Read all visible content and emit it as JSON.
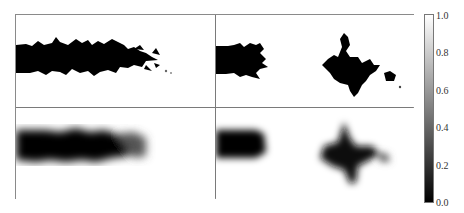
{
  "figure": {
    "panels": [
      {
        "id": "top-left",
        "description": "binary sharp dark plume extending from left edge, fragmented fingers at tip"
      },
      {
        "id": "top-right",
        "description": "binary sharp dark slab at left and detached irregular blob in center-right"
      },
      {
        "id": "bottom-left",
        "description": "smoothed/blurred dark plume extending from left edge"
      },
      {
        "id": "bottom-right",
        "description": "smoothed dark slab at left and blurred star-shaped blob"
      }
    ],
    "colorbar": {
      "ticks": [
        "1.0",
        "0.8",
        "0.6",
        "0.4",
        "0.2",
        "0.0"
      ],
      "min": 0.0,
      "max": 1.0,
      "colormap": "gray",
      "low_color": "#000000",
      "high_color": "#ffffff"
    }
  }
}
